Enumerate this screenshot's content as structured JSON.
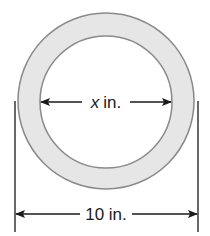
{
  "diagram": {
    "type": "annulus-with-dimensions",
    "colors": {
      "ring_fill": "#e6e6e6",
      "ring_stroke": "#8a8a8a",
      "inner_fill": "#ffffff",
      "line": "#1a1a1a"
    },
    "outer_circle": {
      "cx": 106,
      "cy": 101,
      "r": 88
    },
    "inner_circle": {
      "cx": 106,
      "cy": 102,
      "r": 66
    },
    "inner_dimension": {
      "variable": "x",
      "unit": "in.",
      "label": "x in.",
      "y": 102
    },
    "outer_dimension": {
      "value": "10",
      "unit": "in.",
      "label": "10 in.",
      "y": 214
    }
  }
}
